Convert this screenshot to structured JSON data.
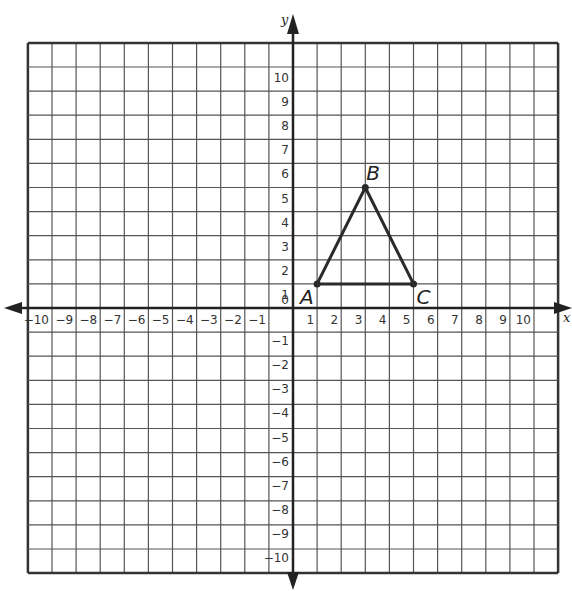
{
  "chart_data": {
    "type": "coordinate-plane",
    "title": "",
    "xlabel": "x",
    "ylabel": "y",
    "xlim": [
      -11,
      11
    ],
    "ylim": [
      -11,
      11
    ],
    "grid": true,
    "x_ticks": [
      -10,
      -9,
      -8,
      -7,
      -6,
      -5,
      -4,
      -3,
      -2,
      -1,
      1,
      2,
      3,
      4,
      5,
      6,
      7,
      8,
      9,
      10
    ],
    "y_ticks": [
      10,
      9,
      8,
      7,
      6,
      5,
      4,
      3,
      2,
      1,
      0,
      -1,
      -2,
      -3,
      -4,
      -5,
      -6,
      -7,
      -8,
      -9,
      -10
    ],
    "points": [
      {
        "label": "A",
        "x": 1,
        "y": 1
      },
      {
        "label": "B",
        "x": 3,
        "y": 5
      },
      {
        "label": "C",
        "x": 5,
        "y": 1
      }
    ],
    "polygon": [
      "A",
      "B",
      "C"
    ]
  },
  "colors": {
    "grid": "#555555",
    "axis": "#222222",
    "triangle": "#2a2a2a"
  }
}
